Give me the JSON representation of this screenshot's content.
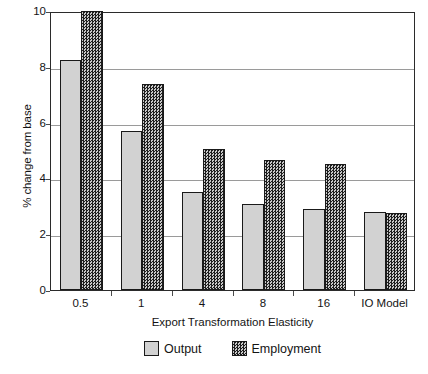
{
  "chart_data": {
    "type": "bar",
    "title": "",
    "xlabel": "Export Transformation Elasticity",
    "ylabel": "% change from base",
    "categories": [
      "0.5",
      "1",
      "4",
      "8",
      "16",
      "IO Model"
    ],
    "series": [
      {
        "name": "Output",
        "values": [
          8.25,
          5.7,
          3.5,
          3.1,
          2.9,
          2.8
        ]
      },
      {
        "name": "Employment",
        "values": [
          10.0,
          7.4,
          5.05,
          4.65,
          4.5,
          2.75
        ]
      }
    ],
    "ylim": [
      0,
      10
    ],
    "yticks": [
      0,
      2,
      4,
      6,
      8,
      10
    ],
    "ytick_labels": [
      "0",
      "2",
      "4",
      "6",
      "8",
      "10"
    ],
    "grid": true,
    "legend_position": "bottom",
    "colors": {
      "output": "#d2d2d2",
      "employment": "#3d3d3d",
      "bar_outline": "#1a1a1a",
      "gridline": "#9a9a9a",
      "frame": "#2b2b2b",
      "text": "#141414",
      "background": "#ffffff"
    }
  },
  "legend": {
    "items": [
      {
        "label": "Output",
        "swatch": "output-swatch"
      },
      {
        "label": "Employment",
        "swatch": "employment-swatch"
      }
    ]
  }
}
